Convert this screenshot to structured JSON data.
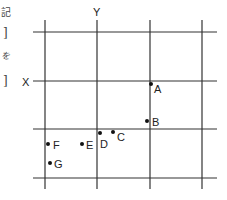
{
  "side_text": [
    "記",
    "]",
    "を",
    "]"
  ],
  "diagram": {
    "axis_labels": {
      "y": "Y",
      "x": "X"
    },
    "grid": {
      "vertical_x": [
        45,
        97,
        150,
        202
      ],
      "horizontal_y": [
        32,
        81,
        129,
        178
      ]
    },
    "points": [
      {
        "label": "A",
        "x": 151,
        "y": 84
      },
      {
        "label": "B",
        "x": 147,
        "y": 121
      },
      {
        "label": "C",
        "x": 113,
        "y": 132
      },
      {
        "label": "D",
        "x": 100,
        "y": 133
      },
      {
        "label": "E",
        "x": 82,
        "y": 144
      },
      {
        "label": "F",
        "x": 48,
        "y": 144
      },
      {
        "label": "G",
        "x": 50,
        "y": 163
      }
    ]
  }
}
